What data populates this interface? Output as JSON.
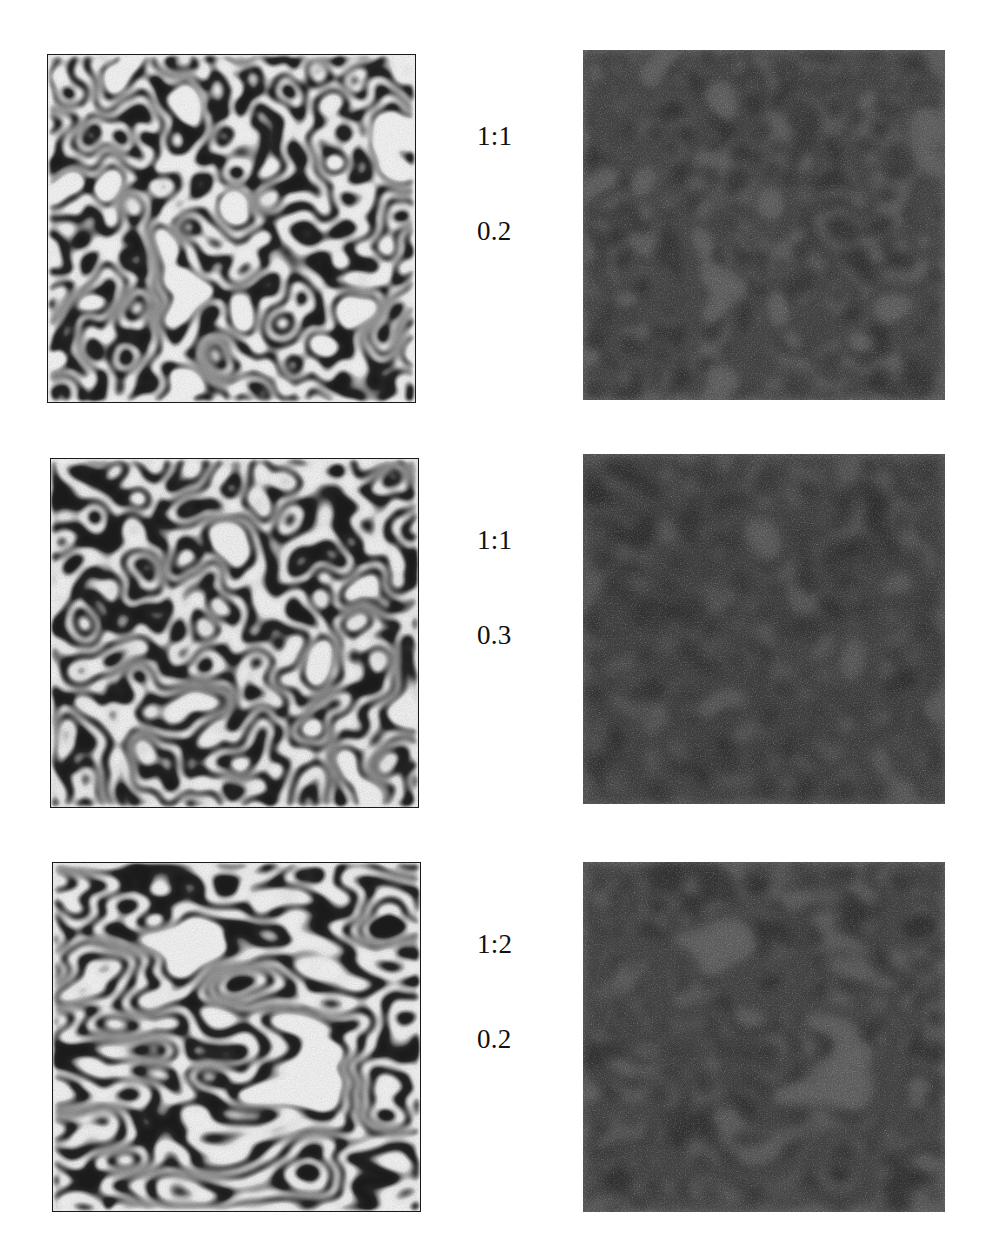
{
  "figure": {
    "background_color": "#ffffff",
    "columns": 2,
    "rows": 3,
    "column_roles": [
      "high-contrast-pattern",
      "low-contrast-noisy-pattern"
    ],
    "frame_color": "#1a1a1a"
  },
  "rows": [
    {
      "index": 1,
      "label_ratio": "1:1",
      "label_value": "0.2",
      "left_panel": {
        "name": "turing-pattern-row1-left",
        "x": 47,
        "y": 54,
        "width": 369,
        "height": 349,
        "contrast": "high",
        "dark_color": "#1c1c1c",
        "light_color": "#f7f7f7",
        "pattern": "labyrinthine-stripes-with-spots",
        "stripe_scale": 0.0185,
        "anisotropy": 1.0,
        "noise_amount": 0.2,
        "seed": 11
      },
      "right_panel": {
        "name": "turing-pattern-row1-right",
        "x": 583,
        "y": 50,
        "width": 362,
        "height": 350,
        "contrast": "low",
        "dark_color": "#333333",
        "light_color": "#5e5e5e",
        "pattern": "labyrinthine-stripes-with-spots",
        "stripe_scale": 0.0185,
        "anisotropy": 1.0,
        "noise_amount": 0.2,
        "seed": 11
      }
    },
    {
      "index": 2,
      "label_ratio": "1:1",
      "label_value": "0.3",
      "left_panel": {
        "name": "turing-pattern-row2-left",
        "x": 50,
        "y": 458,
        "width": 369,
        "height": 350,
        "contrast": "high",
        "dark_color": "#1c1c1c",
        "light_color": "#f7f7f7",
        "pattern": "labyrinthine-stripes-wavy",
        "stripe_scale": 0.0175,
        "anisotropy": 1.0,
        "noise_amount": 0.3,
        "seed": 27
      },
      "right_panel": {
        "name": "turing-pattern-row2-right",
        "x": 583,
        "y": 454,
        "width": 362,
        "height": 350,
        "contrast": "low",
        "dark_color": "#333333",
        "light_color": "#5e5e5e",
        "pattern": "labyrinthine-stripes-wavy",
        "stripe_scale": 0.0175,
        "anisotropy": 1.0,
        "noise_amount": 0.3,
        "seed": 27
      }
    },
    {
      "index": 3,
      "label_ratio": "1:2",
      "label_value": "0.2",
      "left_panel": {
        "name": "turing-pattern-row3-left",
        "x": 52,
        "y": 862,
        "width": 369,
        "height": 350,
        "contrast": "high",
        "dark_color": "#1c1c1c",
        "light_color": "#f7f7f7",
        "pattern": "anisotropic-diagonal-labyrinth",
        "stripe_scale": 0.016,
        "anisotropy": 2.0,
        "noise_amount": 0.2,
        "seed": 43
      },
      "right_panel": {
        "name": "turing-pattern-row3-right",
        "x": 583,
        "y": 862,
        "width": 362,
        "height": 350,
        "contrast": "low",
        "dark_color": "#333333",
        "light_color": "#5e5e5e",
        "pattern": "anisotropic-diagonal-labyrinth",
        "stripe_scale": 0.016,
        "anisotropy": 2.0,
        "noise_amount": 0.2,
        "seed": 43
      }
    }
  ],
  "labels": [
    {
      "name": "param-label-row1",
      "x": 477,
      "y": 58,
      "ratio": "1:1",
      "value": "0.2"
    },
    {
      "name": "param-label-row2",
      "x": 477,
      "y": 462,
      "ratio": "1:1",
      "value": "0.3"
    },
    {
      "name": "param-label-row3",
      "x": 477,
      "y": 866,
      "ratio": "1:2",
      "value": "0.2"
    }
  ]
}
